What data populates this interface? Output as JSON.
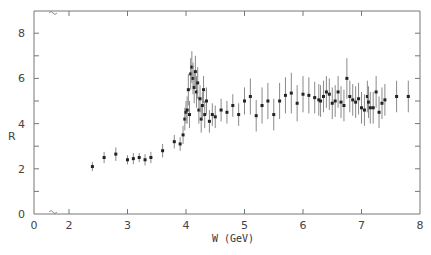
{
  "chart_data": {
    "type": "scatter",
    "title": "",
    "xlabel": "W (GeV)",
    "ylabel": "R",
    "xlim": [
      0,
      8
    ],
    "ylim": [
      0,
      8.8
    ],
    "x_ticks": [
      "0",
      "2",
      "3",
      "4",
      "5",
      "6",
      "7",
      "8"
    ],
    "y_ticks": [
      "0",
      "2",
      "4",
      "6",
      "8"
    ],
    "axis_break": "between 0 and 2 on x-axis",
    "grid": false,
    "legend": null,
    "error_bars": true,
    "series": [
      {
        "name": "R measurements",
        "points": [
          {
            "x": 2.4,
            "y": 2.1,
            "err": 0.2
          },
          {
            "x": 2.6,
            "y": 2.5,
            "err": 0.25
          },
          {
            "x": 2.8,
            "y": 2.65,
            "err": 0.3
          },
          {
            "x": 3.0,
            "y": 2.4,
            "err": 0.2
          },
          {
            "x": 3.1,
            "y": 2.45,
            "err": 0.25
          },
          {
            "x": 3.2,
            "y": 2.5,
            "err": 0.2
          },
          {
            "x": 3.3,
            "y": 2.4,
            "err": 0.25
          },
          {
            "x": 3.4,
            "y": 2.5,
            "err": 0.25
          },
          {
            "x": 3.6,
            "y": 2.8,
            "err": 0.3
          },
          {
            "x": 3.8,
            "y": 3.2,
            "err": 0.3
          },
          {
            "x": 3.9,
            "y": 3.1,
            "err": 0.3
          },
          {
            "x": 3.95,
            "y": 3.5,
            "err": 0.4
          },
          {
            "x": 3.98,
            "y": 4.2,
            "err": 0.5
          },
          {
            "x": 4.0,
            "y": 4.5,
            "err": 0.5
          },
          {
            "x": 4.02,
            "y": 4.6,
            "err": 0.6
          },
          {
            "x": 4.04,
            "y": 5.5,
            "err": 0.7
          },
          {
            "x": 4.06,
            "y": 4.4,
            "err": 0.6
          },
          {
            "x": 4.08,
            "y": 6.2,
            "err": 0.7
          },
          {
            "x": 4.1,
            "y": 6.5,
            "err": 0.7
          },
          {
            "x": 4.12,
            "y": 6.0,
            "err": 0.7
          },
          {
            "x": 4.14,
            "y": 5.6,
            "err": 0.7
          },
          {
            "x": 4.16,
            "y": 6.3,
            "err": 0.7
          },
          {
            "x": 4.18,
            "y": 5.4,
            "err": 0.7
          },
          {
            "x": 4.2,
            "y": 5.8,
            "err": 0.7
          },
          {
            "x": 4.22,
            "y": 4.6,
            "err": 0.6
          },
          {
            "x": 4.24,
            "y": 5.1,
            "err": 0.6
          },
          {
            "x": 4.26,
            "y": 4.2,
            "err": 0.6
          },
          {
            "x": 4.28,
            "y": 4.8,
            "err": 0.6
          },
          {
            "x": 4.3,
            "y": 5.5,
            "err": 0.6
          },
          {
            "x": 4.32,
            "y": 4.4,
            "err": 0.6
          },
          {
            "x": 4.35,
            "y": 5.0,
            "err": 0.6
          },
          {
            "x": 4.4,
            "y": 4.1,
            "err": 0.5
          },
          {
            "x": 4.45,
            "y": 4.4,
            "err": 0.5
          },
          {
            "x": 4.5,
            "y": 4.3,
            "err": 0.5
          },
          {
            "x": 4.6,
            "y": 4.6,
            "err": 0.5
          },
          {
            "x": 4.7,
            "y": 4.5,
            "err": 0.5
          },
          {
            "x": 4.8,
            "y": 4.8,
            "err": 0.5
          },
          {
            "x": 4.9,
            "y": 4.4,
            "err": 0.5
          },
          {
            "x": 5.0,
            "y": 5.0,
            "err": 0.6
          },
          {
            "x": 5.1,
            "y": 5.2,
            "err": 0.8
          },
          {
            "x": 5.2,
            "y": 4.35,
            "err": 0.7
          },
          {
            "x": 5.3,
            "y": 4.8,
            "err": 0.8
          },
          {
            "x": 5.4,
            "y": 5.0,
            "err": 0.8
          },
          {
            "x": 5.5,
            "y": 4.4,
            "err": 0.7
          },
          {
            "x": 5.6,
            "y": 5.0,
            "err": 0.8
          },
          {
            "x": 5.7,
            "y": 5.25,
            "err": 0.8
          },
          {
            "x": 5.8,
            "y": 5.35,
            "err": 0.9
          },
          {
            "x": 5.9,
            "y": 4.9,
            "err": 0.8
          },
          {
            "x": 6.0,
            "y": 5.3,
            "err": 0.8
          },
          {
            "x": 6.1,
            "y": 5.25,
            "err": 0.8
          },
          {
            "x": 6.2,
            "y": 5.15,
            "err": 0.7
          },
          {
            "x": 6.27,
            "y": 5.05,
            "err": 0.7
          },
          {
            "x": 6.3,
            "y": 5.0,
            "err": 0.7
          },
          {
            "x": 6.35,
            "y": 5.2,
            "err": 0.7
          },
          {
            "x": 6.4,
            "y": 5.4,
            "err": 0.7
          },
          {
            "x": 6.45,
            "y": 5.3,
            "err": 0.7
          },
          {
            "x": 6.5,
            "y": 4.9,
            "err": 0.7
          },
          {
            "x": 6.55,
            "y": 5.0,
            "err": 0.7
          },
          {
            "x": 6.6,
            "y": 5.4,
            "err": 0.7
          },
          {
            "x": 6.65,
            "y": 4.95,
            "err": 0.7
          },
          {
            "x": 6.7,
            "y": 4.8,
            "err": 0.7
          },
          {
            "x": 6.75,
            "y": 6.0,
            "err": 0.9
          },
          {
            "x": 6.8,
            "y": 5.2,
            "err": 0.7
          },
          {
            "x": 6.85,
            "y": 5.05,
            "err": 0.7
          },
          {
            "x": 6.9,
            "y": 4.95,
            "err": 0.7
          },
          {
            "x": 6.95,
            "y": 5.1,
            "err": 0.7
          },
          {
            "x": 7.0,
            "y": 4.7,
            "err": 0.7
          },
          {
            "x": 7.05,
            "y": 4.6,
            "err": 0.7
          },
          {
            "x": 7.1,
            "y": 5.2,
            "err": 0.7
          },
          {
            "x": 7.12,
            "y": 4.95,
            "err": 0.7
          },
          {
            "x": 7.15,
            "y": 4.7,
            "err": 0.7
          },
          {
            "x": 7.2,
            "y": 4.7,
            "err": 0.7
          },
          {
            "x": 7.25,
            "y": 5.4,
            "err": 0.7
          },
          {
            "x": 7.3,
            "y": 4.5,
            "err": 0.7
          },
          {
            "x": 7.35,
            "y": 4.9,
            "err": 0.7
          },
          {
            "x": 7.4,
            "y": 5.05,
            "err": 0.7
          },
          {
            "x": 7.6,
            "y": 5.2,
            "err": 0.7
          },
          {
            "x": 7.8,
            "y": 5.2,
            "err": 0.7
          }
        ]
      }
    ]
  }
}
